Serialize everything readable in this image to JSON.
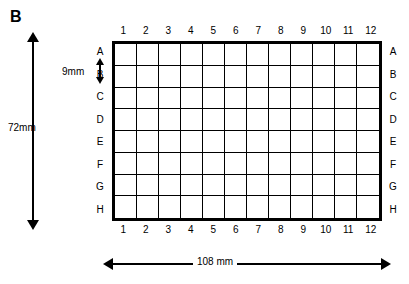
{
  "figure": {
    "panel_label": "B",
    "plate": {
      "columns": [
        "1",
        "2",
        "3",
        "4",
        "5",
        "6",
        "7",
        "8",
        "9",
        "10",
        "11",
        "12"
      ],
      "rows": [
        "A",
        "B",
        "C",
        "D",
        "E",
        "F",
        "G",
        "H"
      ],
      "well_count": 96,
      "border_color": "#000000",
      "background_color": "#ffffff"
    },
    "dimensions": {
      "height_label": "72mm",
      "well_pitch_label": "9mm",
      "width_label": "108 mm"
    }
  }
}
